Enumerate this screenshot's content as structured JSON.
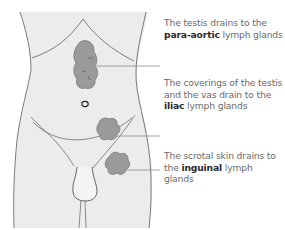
{
  "diagram": {
    "colors": {
      "body_fill": "#ececec",
      "outline": "#6e6e6e",
      "gland_fill": "#9a9a9a",
      "leader_line": "#8a8a8a",
      "text": "#6a6a6a",
      "text_bold": "#2a2a2a"
    },
    "labels": [
      {
        "id": "para-aortic",
        "before": "The testis drains to the ",
        "bold": "para-aortic",
        "after": " lymph glands"
      },
      {
        "id": "iliac",
        "before": "The coverings of the testis and the vas drain to the ",
        "bold": "iliac",
        "after": " lymph glands"
      },
      {
        "id": "inguinal",
        "before": "The scrotal skin drains to the ",
        "bold": "inguinal",
        "after": " lymph glands"
      }
    ]
  }
}
